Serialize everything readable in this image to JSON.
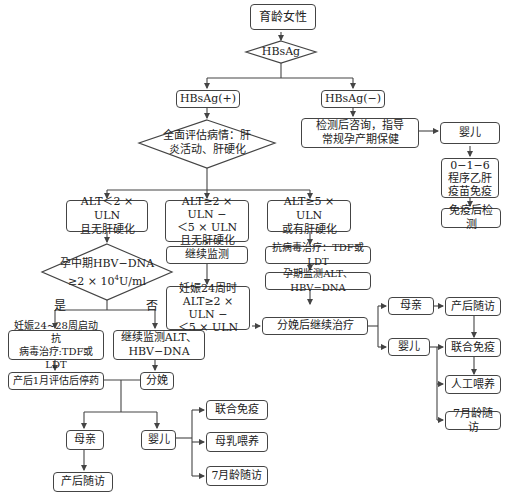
{
  "title": "育龄女性",
  "nodes": {
    "start": "育龄女性",
    "hbsag_decision": "HBsAg",
    "hbsag_pos": "HBsAg(+)",
    "hbsag_neg": "HBsAg(−)",
    "neg_consult": "检测后咨询，指导\n常规孕产期保健",
    "neg_infant": "婴儿",
    "neg_vaccine": "0−1−6\n程序乙肝\n疫苗免疫",
    "neg_test": "免疫后检测",
    "assess_decision": "全面评估病情：肝\n炎活动、肝硬化",
    "alt_low": "ALT＜2 × ULN\n且无肝硬化",
    "alt_mid": "ALT≥2 × ULN −\n＜5 × ULN\n且无肝硬化",
    "alt_high": "ALT≥5 × ULN\n或有肝硬化",
    "dna_decision_line1": "孕中期HBV−DNA",
    "dna_decision_line2": "≥2 × 10",
    "dna_decision_exp": "4",
    "dna_decision_unit": "U/ml",
    "mid_monitor": "继续监测",
    "mid_24w": "妊娠24周时\nALT≥2 × ULN −\n＜5 × ULN",
    "high_antiviral": "抗病毒治疗：TDF或LDT",
    "high_monitor": "孕期监测ALT、HBV−DNA",
    "continue_treat": "分娩后继续治疗",
    "ct_mother": "母亲",
    "ct_mother_follow": "产后随访",
    "ct_infant": "婴儿",
    "ct_joint_immune": "联合免疫",
    "ct_formula": "人工喂养",
    "ct_7m": "7月龄随访",
    "yes_label": "是",
    "no_label": "否",
    "yes_treat": "妊娠24~28周启动抗\n病毒治疗:TDF或LDT",
    "no_monitor": "继续监测ALT、\nHBV−DNA",
    "stop_drug": "产后1月评估后停药",
    "delivery": "分娩",
    "low_mother": "母亲",
    "low_mother_follow": "产后随访",
    "low_infant": "婴儿",
    "low_joint_immune": "联合免疫",
    "low_breastfeed": "母乳喂养",
    "low_7m": "7月龄随访"
  },
  "colors": {
    "line": "#444444",
    "text": "#222222",
    "bg": "#ffffff"
  }
}
